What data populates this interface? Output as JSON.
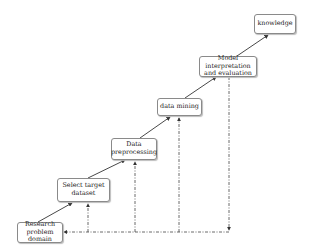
{
  "diagram": {
    "type": "process staircase (knowledge discovery process)",
    "steps": [
      {
        "id": "research",
        "label": "Research problem domain"
      },
      {
        "id": "select",
        "label": "Select target dataset"
      },
      {
        "id": "preprocess",
        "label": "Data preprocessing"
      },
      {
        "id": "mining",
        "label": "data mining"
      },
      {
        "id": "model",
        "label": "Model interpretation and evaluation"
      },
      {
        "id": "knowledge",
        "label": "knowledge"
      }
    ],
    "labels": {
      "research_l1": "Research",
      "research_l2": "problem domain",
      "select_l1": "Select target",
      "select_l2": "dataset",
      "preprocess_l1": "Data",
      "preprocess_l2": "preprocessing",
      "mining": "data mining",
      "model_l1": "Model interpretation",
      "model_l2": "and evaluation",
      "knowledge": "knowledge"
    },
    "edges": [
      {
        "from": "research",
        "to": "select",
        "style": "solid"
      },
      {
        "from": "select",
        "to": "preprocess",
        "style": "solid"
      },
      {
        "from": "preprocess",
        "to": "mining",
        "style": "solid"
      },
      {
        "from": "mining",
        "to": "model",
        "style": "solid"
      },
      {
        "from": "model",
        "to": "knowledge",
        "style": "solid"
      },
      {
        "from": "model",
        "to": "research",
        "style": "dash-dot",
        "note": "feedback loop"
      },
      {
        "from": "feedback",
        "to": "select",
        "style": "dash-dot"
      },
      {
        "from": "feedback",
        "to": "preprocess",
        "style": "dash-dot"
      },
      {
        "from": "feedback",
        "to": "mining",
        "style": "dash-dot"
      }
    ],
    "colors": {
      "line": "#333333",
      "box_border": "#8a8a8a"
    }
  }
}
